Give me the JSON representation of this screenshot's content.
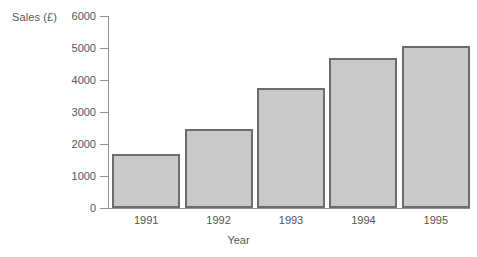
{
  "chart_data": {
    "type": "bar",
    "title": "",
    "xlabel": "Year",
    "ylabel": "Sales (£)",
    "categories": [
      "1991",
      "1992",
      "1993",
      "1994",
      "1995"
    ],
    "values": [
      1700,
      2480,
      3750,
      4700,
      5060
    ],
    "ylim": [
      0,
      6000
    ],
    "yticks": [
      0,
      1000,
      2000,
      3000,
      4000,
      5000,
      6000
    ],
    "ytick_labels": [
      "0",
      "1000",
      "2000",
      "3000",
      "4000",
      "5000",
      "6000"
    ],
    "grid": false,
    "legend": false,
    "bar_fill_color": "#c9c9c9",
    "bar_border_color": "#6c6c6c",
    "axis_color": "#8f8f8f",
    "text_color": "#555555",
    "background_color": "#ffffff"
  }
}
